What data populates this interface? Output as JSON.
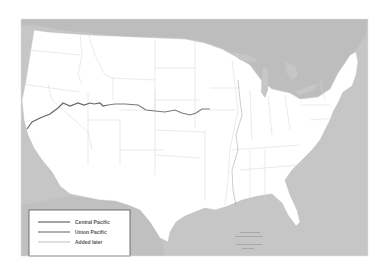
{
  "map": {
    "title": "United States rail map",
    "colors": {
      "water": "#c6c6c6",
      "canada": "#bdbdbd",
      "land": "#ffffff",
      "borders": "#d4d4d4",
      "central_pacific": "#666666",
      "union_pacific": "#7a7a7a",
      "added_later": "#c8c8c8"
    },
    "legend": {
      "items": [
        {
          "label": "Central Pacific",
          "color": "#666666"
        },
        {
          "label": "Union Pacific",
          "color": "#7a7a7a"
        },
        {
          "label": "Added later",
          "color": "#c8c8c8"
        }
      ]
    },
    "routes": [
      {
        "name": "Central Pacific",
        "from": "San Francisco Bay, California",
        "to": "Promontory, Utah"
      },
      {
        "name": "Union Pacific",
        "from": "Promontory, Utah",
        "to": "Council Bluffs / Omaha"
      }
    ]
  }
}
